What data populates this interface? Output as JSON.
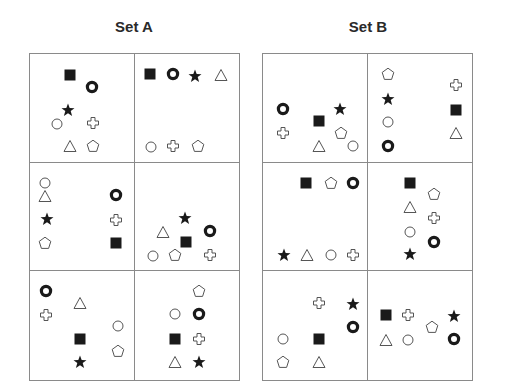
{
  "sets": [
    {
      "title": "Set A",
      "panels": [
        {
          "shapes": [
            {
              "type": "square",
              "x": 40,
              "y": 21
            },
            {
              "type": "ring",
              "x": 62,
              "y": 33
            },
            {
              "type": "star",
              "x": 38,
              "y": 56
            },
            {
              "type": "circle",
              "x": 27,
              "y": 70
            },
            {
              "type": "cross",
              "x": 63,
              "y": 69
            },
            {
              "type": "triangle",
              "x": 40,
              "y": 92
            },
            {
              "type": "pentagon",
              "x": 63,
              "y": 92
            }
          ]
        },
        {
          "shapes": [
            {
              "type": "square",
              "x": 15,
              "y": 20
            },
            {
              "type": "ring",
              "x": 38,
              "y": 20
            },
            {
              "type": "star",
              "x": 60,
              "y": 22
            },
            {
              "type": "triangle",
              "x": 86,
              "y": 21
            },
            {
              "type": "circle",
              "x": 16,
              "y": 93
            },
            {
              "type": "cross",
              "x": 38,
              "y": 92
            },
            {
              "type": "pentagon",
              "x": 63,
              "y": 92
            }
          ]
        },
        {
          "shapes": [
            {
              "type": "circle",
              "x": 15,
              "y": 20
            },
            {
              "type": "triangle",
              "x": 15,
              "y": 33
            },
            {
              "type": "ring",
              "x": 86,
              "y": 32
            },
            {
              "type": "star",
              "x": 17,
              "y": 56
            },
            {
              "type": "cross",
              "x": 86,
              "y": 57
            },
            {
              "type": "pentagon",
              "x": 15,
              "y": 80
            },
            {
              "type": "square",
              "x": 86,
              "y": 80
            }
          ]
        },
        {
          "shapes": [
            {
              "type": "star",
              "x": 50,
              "y": 55
            },
            {
              "type": "triangle",
              "x": 28,
              "y": 69
            },
            {
              "type": "ring",
              "x": 75,
              "y": 68
            },
            {
              "type": "square",
              "x": 51,
              "y": 79
            },
            {
              "type": "circle",
              "x": 18,
              "y": 93
            },
            {
              "type": "pentagon",
              "x": 40,
              "y": 92
            },
            {
              "type": "cross",
              "x": 75,
              "y": 92
            }
          ]
        },
        {
          "shapes": [
            {
              "type": "ring",
              "x": 16,
              "y": 20
            },
            {
              "type": "triangle",
              "x": 50,
              "y": 32
            },
            {
              "type": "cross",
              "x": 16,
              "y": 44
            },
            {
              "type": "circle",
              "x": 88,
              "y": 55
            },
            {
              "type": "square",
              "x": 50,
              "y": 68
            },
            {
              "type": "pentagon",
              "x": 88,
              "y": 80
            },
            {
              "type": "star",
              "x": 50,
              "y": 91
            }
          ]
        },
        {
          "shapes": [
            {
              "type": "pentagon",
              "x": 64,
              "y": 20
            },
            {
              "type": "circle",
              "x": 40,
              "y": 43
            },
            {
              "type": "ring",
              "x": 64,
              "y": 43
            },
            {
              "type": "square",
              "x": 40,
              "y": 68
            },
            {
              "type": "cross",
              "x": 64,
              "y": 68
            },
            {
              "type": "triangle",
              "x": 40,
              "y": 91
            },
            {
              "type": "star",
              "x": 64,
              "y": 91
            }
          ]
        }
      ]
    },
    {
      "title": "Set B",
      "panels": [
        {
          "shapes": [
            {
              "type": "ring",
              "x": 20,
              "y": 55
            },
            {
              "type": "star",
              "x": 77,
              "y": 55
            },
            {
              "type": "square",
              "x": 56,
              "y": 67
            },
            {
              "type": "cross",
              "x": 20,
              "y": 79
            },
            {
              "type": "pentagon",
              "x": 78,
              "y": 79
            },
            {
              "type": "triangle",
              "x": 56,
              "y": 92
            },
            {
              "type": "circle",
              "x": 90,
              "y": 92
            }
          ]
        },
        {
          "shapes": [
            {
              "type": "pentagon",
              "x": 20,
              "y": 20
            },
            {
              "type": "cross",
              "x": 88,
              "y": 31
            },
            {
              "type": "star",
              "x": 20,
              "y": 45
            },
            {
              "type": "square",
              "x": 88,
              "y": 56
            },
            {
              "type": "circle",
              "x": 20,
              "y": 68
            },
            {
              "type": "triangle",
              "x": 88,
              "y": 79
            },
            {
              "type": "ring",
              "x": 20,
              "y": 92
            }
          ]
        },
        {
          "shapes": [
            {
              "type": "square",
              "x": 43,
              "y": 20
            },
            {
              "type": "pentagon",
              "x": 68,
              "y": 20
            },
            {
              "type": "ring",
              "x": 90,
              "y": 20
            },
            {
              "type": "star",
              "x": 21,
              "y": 92
            },
            {
              "type": "triangle",
              "x": 44,
              "y": 92
            },
            {
              "type": "circle",
              "x": 68,
              "y": 92
            },
            {
              "type": "cross",
              "x": 90,
              "y": 92
            }
          ]
        },
        {
          "shapes": [
            {
              "type": "square",
              "x": 42,
              "y": 20
            },
            {
              "type": "pentagon",
              "x": 66,
              "y": 31
            },
            {
              "type": "triangle",
              "x": 42,
              "y": 44
            },
            {
              "type": "cross",
              "x": 66,
              "y": 55
            },
            {
              "type": "circle",
              "x": 42,
              "y": 69
            },
            {
              "type": "ring",
              "x": 66,
              "y": 79
            },
            {
              "type": "star",
              "x": 42,
              "y": 91
            }
          ]
        },
        {
          "shapes": [
            {
              "type": "cross",
              "x": 56,
              "y": 32
            },
            {
              "type": "star",
              "x": 90,
              "y": 33
            },
            {
              "type": "ring",
              "x": 90,
              "y": 56
            },
            {
              "type": "circle",
              "x": 20,
              "y": 68
            },
            {
              "type": "square",
              "x": 56,
              "y": 68
            },
            {
              "type": "pentagon",
              "x": 20,
              "y": 91
            },
            {
              "type": "triangle",
              "x": 56,
              "y": 91
            }
          ]
        },
        {
          "shapes": [
            {
              "type": "square",
              "x": 18,
              "y": 44
            },
            {
              "type": "cross",
              "x": 40,
              "y": 44
            },
            {
              "type": "star",
              "x": 86,
              "y": 45
            },
            {
              "type": "pentagon",
              "x": 64,
              "y": 56
            },
            {
              "type": "triangle",
              "x": 18,
              "y": 69
            },
            {
              "type": "circle",
              "x": 40,
              "y": 69
            },
            {
              "type": "ring",
              "x": 86,
              "y": 68
            }
          ]
        }
      ]
    }
  ],
  "colors": {
    "border": "#8a8a8a",
    "filled": "#1a1a1a",
    "outline": "#555555",
    "title": "#2a2a2a"
  }
}
